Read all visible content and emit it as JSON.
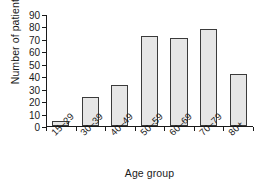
{
  "chart_data": {
    "type": "bar",
    "title": "",
    "subtitle": "",
    "xlabel": "Age group",
    "ylabel": "Number of patients",
    "categories": [
      "15–29",
      "30–39",
      "40–49",
      "50–59",
      "60–69",
      "70–79",
      "80+"
    ],
    "values": [
      4,
      23,
      33,
      72,
      71,
      78,
      42
    ],
    "ylim": [
      0,
      90
    ],
    "yticks": [
      0,
      10,
      20,
      30,
      40,
      50,
      60,
      70,
      80,
      90
    ],
    "ytick_labels": [
      "0",
      "10",
      "20",
      "30",
      "40",
      "50",
      "60",
      "70",
      "80",
      "90"
    ],
    "grid": false,
    "legend": null,
    "series": [
      {
        "name": "Number of patients",
        "values": [
          4,
          23,
          33,
          72,
          71,
          78,
          42
        ]
      }
    ],
    "colors": {
      "bar_fill": "#e6e6e6",
      "bar_edge": "#3b3b3b",
      "axis": "#1a1a1a",
      "background": "#ffffff",
      "text": "#1a1a1a"
    }
  }
}
